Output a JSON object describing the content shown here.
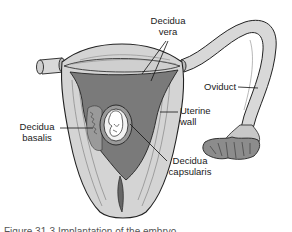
{
  "diagram": {
    "labels": {
      "decidua_vera": [
        "Decidua",
        "vera"
      ],
      "oviduct": "Oviduct",
      "uterine_wall": [
        "Uterine",
        "wall"
      ],
      "decidua_basalis": [
        "Decidua",
        "basalis"
      ],
      "decidua_capsularis": [
        "Decidua",
        "capsularis"
      ]
    },
    "caption_partial": "Figure 31-3 Implantation of the embryo"
  },
  "colors": {
    "wall_fill": "#d4d4d4",
    "cavity_fill": "#7a7a7a",
    "decidua_fill": "#9a9a9a",
    "outline": "#222222",
    "background": "#ffffff"
  }
}
